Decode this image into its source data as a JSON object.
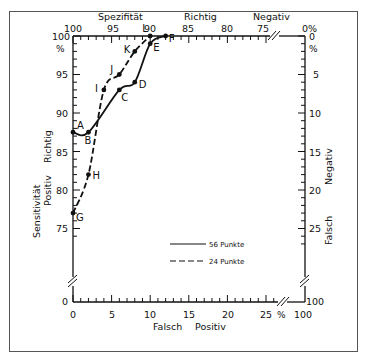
{
  "chart_data": {
    "type": "line",
    "title": "",
    "top_axis": {
      "label_words": [
        "Spezifität",
        "Richtig",
        "Negativ"
      ],
      "ticks": [
        "100",
        "95",
        "90",
        "85",
        "80",
        "75",
        "0%"
      ]
    },
    "left_axis": {
      "label_line1": "Sensitivität",
      "label_line2a": "Positiv",
      "label_line2b": "Richtig",
      "ticks": [
        "100",
        "%",
        "95",
        "90",
        "85",
        "80",
        "75",
        "0"
      ]
    },
    "right_axis": {
      "label_a": "Falsch",
      "label_b": "Negativ",
      "ticks": [
        "0",
        "%",
        "5",
        "10",
        "15",
        "20",
        "25",
        "100"
      ]
    },
    "bottom_axis": {
      "label_a": "Falsch",
      "label_b": "Positiv",
      "ticks": [
        "0",
        "5",
        "10",
        "15",
        "20",
        "25",
        "%",
        "100"
      ]
    },
    "xlabel": "Falsch Positiv (%)",
    "ylabel": "Sensitivität / Richtig Positiv (%)",
    "xlim": [
      0,
      30
    ],
    "ylim": [
      75,
      100
    ],
    "grid": false,
    "legend_position": "lower right inside",
    "series": [
      {
        "name": "56 Punkte",
        "style": "solid",
        "points": [
          {
            "label": "A",
            "x": 0,
            "y": 87.5
          },
          {
            "label": "B",
            "x": 2,
            "y": 87.5
          },
          {
            "label": "C",
            "x": 6,
            "y": 93
          },
          {
            "label": "D",
            "x": 8,
            "y": 94
          },
          {
            "label": "E",
            "x": 10,
            "y": 99
          },
          {
            "label": "F",
            "x": 12,
            "y": 100
          }
        ]
      },
      {
        "name": "24 Punkte",
        "style": "dashed",
        "points": [
          {
            "label": "G",
            "x": 0,
            "y": 77
          },
          {
            "label": "H",
            "x": 2,
            "y": 82
          },
          {
            "label": "I",
            "x": 4,
            "y": 93
          },
          {
            "label": "J",
            "x": 6,
            "y": 95
          },
          {
            "label": "K",
            "x": 8,
            "y": 98
          },
          {
            "label": "L",
            "x": 10,
            "y": 100
          }
        ]
      }
    ]
  },
  "legend": {
    "solid_label": "56 Punkte",
    "dashed_label": "24 Punkte"
  }
}
